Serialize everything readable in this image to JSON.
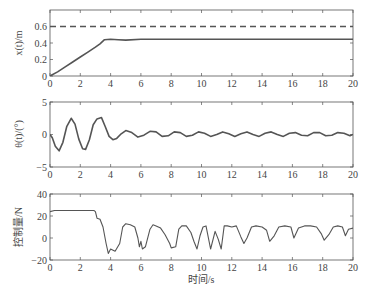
{
  "chart_data": [
    {
      "type": "line",
      "title": "",
      "xlabel": "",
      "ylabel": "x(t)/m",
      "xlim": [
        0,
        20
      ],
      "ylim": [
        0,
        0.8
      ],
      "xticks": [
        0,
        2,
        4,
        6,
        8,
        10,
        12,
        14,
        16,
        18,
        20
      ],
      "yticks": [
        0,
        0.2,
        0.4,
        0.6
      ],
      "ytick_labels": [
        "0",
        "0.2",
        "0.4",
        "0.6"
      ],
      "grid": false,
      "series": [
        {
          "name": "reference",
          "style": "dashed",
          "x": [
            0,
            20
          ],
          "y": [
            0.6,
            0.6
          ]
        },
        {
          "name": "position",
          "style": "solid",
          "x": [
            0,
            0.5,
            1,
            1.5,
            2,
            2.5,
            3,
            3.3,
            3.6,
            4,
            4.5,
            5,
            6,
            8,
            10,
            12,
            14,
            16,
            18,
            20
          ],
          "y": [
            0,
            0.05,
            0.11,
            0.17,
            0.23,
            0.29,
            0.35,
            0.39,
            0.44,
            0.445,
            0.44,
            0.435,
            0.445,
            0.445,
            0.445,
            0.445,
            0.445,
            0.445,
            0.445,
            0.445
          ]
        }
      ]
    },
    {
      "type": "line",
      "title": "",
      "xlabel": "",
      "ylabel": "θ(t)/(°)",
      "xlim": [
        0,
        20
      ],
      "ylim": [
        -5,
        5
      ],
      "xticks": [
        0,
        2,
        4,
        6,
        8,
        10,
        12,
        14,
        16,
        18,
        20
      ],
      "yticks": [
        -5,
        0,
        5
      ],
      "ytick_labels": [
        "−5",
        "0",
        "5"
      ],
      "grid": false,
      "series": [
        {
          "name": "angle",
          "style": "solid",
          "x": [
            0,
            0.15,
            0.35,
            0.6,
            0.85,
            1.1,
            1.4,
            1.65,
            1.9,
            2.15,
            2.35,
            2.6,
            2.85,
            3.1,
            3.4,
            3.65,
            3.9,
            4.15,
            4.4,
            4.7,
            5.0,
            5.4,
            5.8,
            6.2,
            6.6,
            7.0,
            7.4,
            7.8,
            8.2,
            8.6,
            9.0,
            9.4,
            9.8,
            10.2,
            10.6,
            11.0,
            11.4,
            11.8,
            12.2,
            12.6,
            13.0,
            13.4,
            13.8,
            14.2,
            14.6,
            15.0,
            15.4,
            15.8,
            16.2,
            16.6,
            17.0,
            17.4,
            17.8,
            18.2,
            18.6,
            19.0,
            19.4,
            19.8,
            20
          ],
          "y": [
            0,
            -0.5,
            -1.8,
            -2.5,
            -1.2,
            1.2,
            2.5,
            1.6,
            -0.7,
            -2.2,
            -2.3,
            -0.8,
            1.5,
            2.4,
            2.6,
            1.2,
            -0.3,
            -0.8,
            -0.6,
            0.1,
            0.6,
            0.3,
            -0.4,
            -0.1,
            0.5,
            0.4,
            -0.3,
            -0.2,
            0.4,
            0.3,
            -0.3,
            -0.1,
            0.4,
            0.2,
            -0.3,
            0.0,
            0.4,
            0.1,
            -0.3,
            0.1,
            0.4,
            0.0,
            -0.3,
            0.2,
            0.4,
            0.0,
            -0.3,
            0.2,
            0.3,
            -0.1,
            -0.2,
            0.3,
            0.3,
            -0.2,
            -0.1,
            0.3,
            0.2,
            -0.2,
            0.0
          ]
        }
      ]
    },
    {
      "type": "line",
      "title": "",
      "xlabel": "时间/s",
      "ylabel": "控制量/N",
      "xlim": [
        0,
        20
      ],
      "ylim": [
        -20,
        40
      ],
      "xticks": [
        0,
        2,
        4,
        6,
        8,
        10,
        12,
        14,
        16,
        18,
        20
      ],
      "yticks": [
        -20,
        0,
        20,
        40
      ],
      "ytick_labels": [
        "−20",
        "0",
        "20",
        "40"
      ],
      "grid": false,
      "series": [
        {
          "name": "control",
          "style": "solid",
          "x": [
            0,
            0.3,
            1,
            2,
            2.9,
            3.0,
            3.1,
            3.3,
            3.5,
            3.7,
            3.85,
            4.0,
            4.3,
            4.6,
            4.8,
            5.0,
            5.3,
            5.6,
            5.8,
            5.9,
            6.0,
            6.1,
            6.3,
            6.6,
            6.8,
            7.0,
            7.3,
            7.6,
            7.9,
            8.0,
            8.3,
            8.5,
            8.7,
            9.0,
            9.3,
            9.5,
            9.7,
            9.9,
            10.1,
            10.3,
            10.6,
            10.9,
            11.1,
            11.3,
            11.5,
            11.7,
            12.0,
            12.3,
            12.6,
            12.8,
            13.0,
            13.3,
            13.6,
            14.0,
            14.3,
            14.5,
            14.8,
            15.1,
            15.5,
            15.9,
            16.1,
            16.4,
            16.8,
            17.2,
            17.6,
            17.9,
            18.1,
            18.4,
            18.7,
            19.0,
            19.3,
            19.5,
            19.7,
            20
          ],
          "y": [
            24,
            25,
            25,
            25,
            25,
            24,
            18,
            17,
            10,
            -5,
            -14,
            -10,
            -12,
            -5,
            10,
            13,
            12,
            10,
            0,
            -8,
            -3,
            -10,
            -8,
            8,
            12,
            11,
            9,
            3,
            -5,
            -9,
            -8,
            8,
            11,
            11,
            5,
            -3,
            -10,
            2,
            10,
            11,
            -10,
            6,
            -1,
            -10,
            11,
            11,
            10,
            11,
            1,
            -5,
            0,
            10,
            11,
            10,
            7,
            -3,
            2,
            10,
            11,
            10,
            0,
            9,
            11,
            11,
            10,
            4,
            -2,
            3,
            10,
            11,
            10,
            2,
            8,
            9
          ]
        }
      ]
    }
  ],
  "panels": [
    {
      "ylabel": "x(t)/m"
    },
    {
      "ylabel": "θ(t)/(°)"
    },
    {
      "ylabel": "控制量/N",
      "xlabel": "时间/s"
    }
  ]
}
